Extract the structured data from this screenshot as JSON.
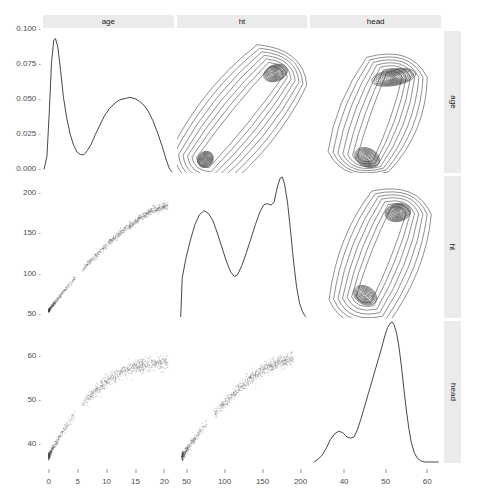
{
  "plot": {
    "type": "scatterplot-matrix",
    "variables": [
      "age",
      "ht",
      "head"
    ],
    "column_strips": [
      "age",
      "ht",
      "head"
    ],
    "row_strips": [
      "age",
      "ht",
      "head"
    ],
    "diagonal": "density",
    "upper_triangle": "contour-density",
    "lower_triangle": "scatter",
    "strip_bg": "#ebebeb",
    "line_color": "#333333",
    "point_color": "#4d4d4d"
  },
  "axes": {
    "y": [
      {
        "row": 1,
        "variable": "density",
        "ticks": [
          "0.000",
          "0.025",
          "0.050",
          "0.075",
          "0.100"
        ],
        "min": 0,
        "max": 0.1
      },
      {
        "row": 2,
        "variable": "ht",
        "ticks": [
          "50",
          "100",
          "150",
          "200"
        ],
        "min": 40,
        "max": 215
      },
      {
        "row": 3,
        "variable": "head",
        "ticks": [
          "40",
          "50",
          "60"
        ],
        "min": 33,
        "max": 65
      }
    ],
    "x": [
      {
        "col": 1,
        "variable": "age",
        "ticks": [
          "0",
          "5",
          "10",
          "15",
          "20"
        ],
        "min": -1,
        "max": 22
      },
      {
        "col": 2,
        "variable": "ht",
        "ticks": [
          "50",
          "100",
          "150",
          "200"
        ],
        "min": 40,
        "max": 215
      },
      {
        "col": 3,
        "variable": "head",
        "ticks": [
          "40",
          "50",
          "60"
        ],
        "min": 33,
        "max": 65
      }
    ]
  },
  "chart_data": {
    "type": "scatter",
    "title": "",
    "xlabel": "",
    "ylabel": "",
    "grid": false,
    "legend": "none",
    "variables": [
      "age",
      "ht",
      "head"
    ],
    "panels": [
      {
        "row": 1,
        "col": 1,
        "kind": "density",
        "xvar": "age",
        "yvar": "density",
        "xlim": [
          -1,
          22
        ],
        "ylim": [
          0,
          0.105
        ],
        "curve": [
          [
            -0.8,
            0.002
          ],
          [
            -0.3,
            0.012
          ],
          [
            0.1,
            0.045
          ],
          [
            0.5,
            0.082
          ],
          [
            0.9,
            0.099
          ],
          [
            1.2,
            0.1
          ],
          [
            1.6,
            0.094
          ],
          [
            2.1,
            0.076
          ],
          [
            2.6,
            0.056
          ],
          [
            3.2,
            0.04
          ],
          [
            3.8,
            0.028
          ],
          [
            4.4,
            0.02
          ],
          [
            5.0,
            0.015
          ],
          [
            5.6,
            0.013
          ],
          [
            6.2,
            0.013
          ],
          [
            6.8,
            0.016
          ],
          [
            7.5,
            0.021
          ],
          [
            8.2,
            0.028
          ],
          [
            9.0,
            0.035
          ],
          [
            9.8,
            0.042
          ],
          [
            10.6,
            0.047
          ],
          [
            11.5,
            0.051
          ],
          [
            12.4,
            0.054
          ],
          [
            13.4,
            0.055
          ],
          [
            14.3,
            0.056
          ],
          [
            15.2,
            0.055
          ],
          [
            16.0,
            0.053
          ],
          [
            16.8,
            0.05
          ],
          [
            17.6,
            0.045
          ],
          [
            18.4,
            0.038
          ],
          [
            19.2,
            0.029
          ],
          [
            20.0,
            0.019
          ],
          [
            20.7,
            0.009
          ],
          [
            21.3,
            0.002
          ],
          [
            21.8,
            0.0
          ]
        ]
      },
      {
        "row": 1,
        "col": 2,
        "kind": "contour",
        "xvar": "ht",
        "yvar": "age",
        "xlim": [
          40,
          215
        ],
        "ylim": [
          -1,
          22
        ],
        "modes": [
          {
            "x": 78,
            "y": 1.2,
            "rx": 10,
            "ry": 1.4,
            "angle": 40,
            "rings": 11
          },
          {
            "x": 172,
            "y": 15.2,
            "rx": 11,
            "ry": 2.0,
            "angle": 70,
            "rings": 10
          }
        ],
        "ridge": "diagonal-banana"
      },
      {
        "row": 1,
        "col": 3,
        "kind": "contour",
        "xvar": "head",
        "yvar": "age",
        "xlim": [
          33,
          65
        ],
        "ylim": [
          -1,
          22
        ],
        "modes": [
          {
            "x": 47,
            "y": 1.5,
            "rx": 3.2,
            "ry": 1.5,
            "angle": 25,
            "rings": 10
          },
          {
            "x": 53.5,
            "y": 14.5,
            "rx": 2.0,
            "ry": 3.6,
            "angle": 80,
            "rings": 11
          }
        ],
        "ridge": "vertical-hook"
      },
      {
        "row": 2,
        "col": 1,
        "kind": "scatter",
        "xvar": "age",
        "yvar": "ht",
        "xlim": [
          -1,
          22
        ],
        "ylim": [
          40,
          215
        ],
        "n_points": 1100,
        "trend": "saturating-growth",
        "description": "height rises steeply from 50cm at age 0 to ~175cm by age 18, then plateaus"
      },
      {
        "row": 2,
        "col": 2,
        "kind": "density",
        "xvar": "ht",
        "yvar": "density",
        "xlim": [
          40,
          215
        ],
        "ylim": [
          0,
          1
        ],
        "curve": [
          [
            45,
            0.0
          ],
          [
            47,
            0.28
          ],
          [
            52,
            0.42
          ],
          [
            58,
            0.55
          ],
          [
            64,
            0.66
          ],
          [
            70,
            0.73
          ],
          [
            76,
            0.76
          ],
          [
            82,
            0.74
          ],
          [
            88,
            0.69
          ],
          [
            94,
            0.6
          ],
          [
            100,
            0.5
          ],
          [
            106,
            0.4
          ],
          [
            112,
            0.32
          ],
          [
            117,
            0.29
          ],
          [
            121,
            0.3
          ],
          [
            127,
            0.37
          ],
          [
            133,
            0.46
          ],
          [
            139,
            0.56
          ],
          [
            145,
            0.66
          ],
          [
            151,
            0.75
          ],
          [
            156,
            0.8
          ],
          [
            161,
            0.81
          ],
          [
            166,
            0.8
          ],
          [
            170,
            0.82
          ],
          [
            174,
            0.92
          ],
          [
            178,
            0.99
          ],
          [
            181,
            1.0
          ],
          [
            184,
            0.95
          ],
          [
            188,
            0.82
          ],
          [
            192,
            0.62
          ],
          [
            196,
            0.4
          ],
          [
            200,
            0.22
          ],
          [
            204,
            0.1
          ],
          [
            208,
            0.04
          ],
          [
            211,
            0.01
          ],
          [
            213,
            0.0
          ]
        ]
      },
      {
        "row": 2,
        "col": 3,
        "kind": "contour",
        "xvar": "head",
        "yvar": "ht",
        "xlim": [
          33,
          65
        ],
        "ylim": [
          40,
          215
        ],
        "modes": [
          {
            "x": 46.5,
            "y": 68,
            "rx": 3.0,
            "ry": 11,
            "angle": 30,
            "rings": 9
          },
          {
            "x": 54.5,
            "y": 170,
            "rx": 2.2,
            "ry": 16,
            "angle": 78,
            "rings": 11
          }
        ],
        "ridge": "diagonal-banana"
      },
      {
        "row": 3,
        "col": 1,
        "kind": "scatter",
        "xvar": "age",
        "yvar": "head",
        "xlim": [
          -1,
          22
        ],
        "ylim": [
          33,
          65
        ],
        "n_points": 1100,
        "trend": "saturating-growth",
        "description": "head circumference rises steeply from 34cm at birth to ~50cm by age 3, then slowly to ~56cm by age 21"
      },
      {
        "row": 3,
        "col": 2,
        "kind": "scatter",
        "xvar": "ht",
        "yvar": "head",
        "xlim": [
          40,
          215
        ],
        "ylim": [
          33,
          65
        ],
        "n_points": 1100,
        "trend": "saturating-growth",
        "description": "head circumference increases with height, steeply below 100cm then gradually"
      },
      {
        "row": 3,
        "col": 3,
        "kind": "density",
        "xvar": "head",
        "yvar": "density",
        "xlim": [
          33,
          65
        ],
        "ylim": [
          0,
          1
        ],
        "curve": [
          [
            34.0,
            0.0
          ],
          [
            35.0,
            0.02
          ],
          [
            36.0,
            0.05
          ],
          [
            37.0,
            0.1
          ],
          [
            38.0,
            0.16
          ],
          [
            39.0,
            0.2
          ],
          [
            40.0,
            0.22
          ],
          [
            41.0,
            0.21
          ],
          [
            42.0,
            0.18
          ],
          [
            43.0,
            0.17
          ],
          [
            43.8,
            0.18
          ],
          [
            44.6,
            0.23
          ],
          [
            45.5,
            0.31
          ],
          [
            46.4,
            0.4
          ],
          [
            47.3,
            0.49
          ],
          [
            48.2,
            0.58
          ],
          [
            49.0,
            0.66
          ],
          [
            49.8,
            0.74
          ],
          [
            50.6,
            0.82
          ],
          [
            51.3,
            0.9
          ],
          [
            52.0,
            0.96
          ],
          [
            52.6,
            0.99
          ],
          [
            53.1,
            1.0
          ],
          [
            53.6,
            0.98
          ],
          [
            54.2,
            0.92
          ],
          [
            54.8,
            0.82
          ],
          [
            55.4,
            0.68
          ],
          [
            56.0,
            0.52
          ],
          [
            56.6,
            0.37
          ],
          [
            57.2,
            0.24
          ],
          [
            57.8,
            0.14
          ],
          [
            58.5,
            0.07
          ],
          [
            59.2,
            0.03
          ],
          [
            60.0,
            0.01
          ],
          [
            61.0,
            0.0
          ],
          [
            64.5,
            0.0
          ]
        ]
      }
    ]
  }
}
